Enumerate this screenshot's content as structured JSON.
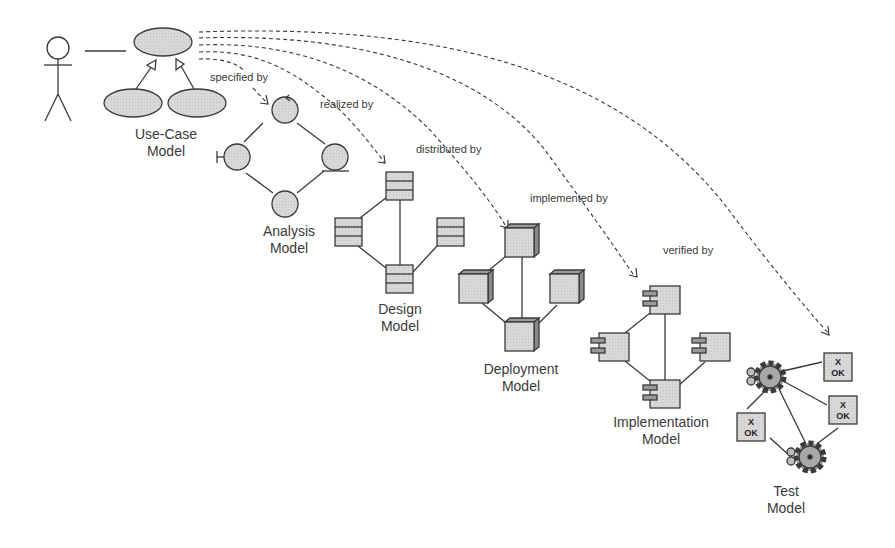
{
  "diagram": {
    "colors": {
      "stroke": "#3a3a3a",
      "fill": "#d6d6d6",
      "fill_dark": "#9a9a9a",
      "text": "#3a3a3a",
      "background": "#ffffff"
    },
    "models": [
      {
        "id": "use-case",
        "title_line1": "Use-Case",
        "title_line2": "Model"
      },
      {
        "id": "analysis",
        "title_line1": "Analysis",
        "title_line2": "Model"
      },
      {
        "id": "design",
        "title_line1": "Design",
        "title_line2": "Model"
      },
      {
        "id": "deployment",
        "title_line1": "Deployment",
        "title_line2": "Model"
      },
      {
        "id": "implementation",
        "title_line1": "Implementation",
        "title_line2": "Model"
      },
      {
        "id": "test",
        "title_line1": "Test",
        "title_line2": "Model"
      }
    ],
    "relationships": [
      {
        "from": "use-case",
        "to": "analysis",
        "label": "specified by"
      },
      {
        "from": "use-case",
        "to": "design",
        "label": "realized by"
      },
      {
        "from": "use-case",
        "to": "deployment",
        "label": "distributed by"
      },
      {
        "from": "use-case",
        "to": "implementation",
        "label": "implemented by"
      },
      {
        "from": "use-case",
        "to": "test",
        "label": "verified by"
      }
    ],
    "test_case_glyph": {
      "line1": "X",
      "line2": "OK"
    }
  }
}
